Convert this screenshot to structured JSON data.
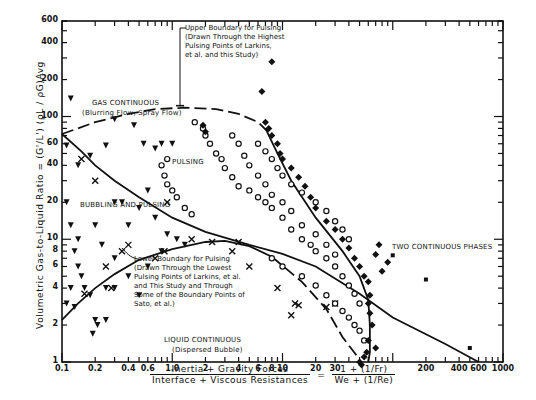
{
  "chart_data": {
    "type": "scatter",
    "title": "",
    "xlabel": "Inertia + Gravity Forces / Interface + Viscous Resistances = (1 + (1/Fr)) / (We + (1/Re))",
    "xlabel_numerator": "Inertia + Gravity Forces",
    "xlabel_denominator": "Interface + Viscous Resistances",
    "xlabel_formula_numerator": "1 + (1/Fr)",
    "xlabel_formula_denominator": "We + (1/Re)",
    "xlabel_equals": "=",
    "ylabel": "Volumetric Gas-to-Liquid Ratio = (G'/L') (ρL / ρG)Avg",
    "xscale": "log",
    "yscale": "log",
    "xlim": [
      0.1,
      1000
    ],
    "ylim": [
      1,
      600
    ],
    "grid": false,
    "x_ticks": [
      {
        "value": 0.1,
        "label": "0.1"
      },
      {
        "value": 0.2,
        "label": "0.2"
      },
      {
        "value": 0.4,
        "label": "0.4"
      },
      {
        "value": 0.6,
        "label": "0.6"
      },
      {
        "value": 1.0,
        "label": "1.0"
      },
      {
        "value": 2,
        "label": "2"
      },
      {
        "value": 4,
        "label": "4"
      },
      {
        "value": 6,
        "label": "6"
      },
      {
        "value": 8,
        "label": "8"
      },
      {
        "value": 10,
        "label": "10"
      },
      {
        "value": 20,
        "label": "20"
      },
      {
        "value": 30,
        "label": "30"
      },
      {
        "value": 200,
        "label": "200"
      },
      {
        "value": 400,
        "label": "400"
      },
      {
        "value": 600,
        "label": "600"
      },
      {
        "value": 1000,
        "label": "1000"
      }
    ],
    "y_ticks": [
      {
        "value": 1,
        "label": "1"
      },
      {
        "value": 2,
        "label": "2"
      },
      {
        "value": 4,
        "label": "4"
      },
      {
        "value": 6,
        "label": "6"
      },
      {
        "value": 8,
        "label": "8"
      },
      {
        "value": 10,
        "label": "10"
      },
      {
        "value": 20,
        "label": "20"
      },
      {
        "value": 40,
        "label": "40"
      },
      {
        "value": 60,
        "label": "60"
      },
      {
        "value": 100,
        "label": "100"
      },
      {
        "value": 200,
        "label": "200"
      },
      {
        "value": 400,
        "label": "400"
      },
      {
        "value": 600,
        "label": "600"
      }
    ],
    "regions": [
      {
        "name": "GAS CONTINUOUS",
        "subtitle": "(Blurring Flow, Spray Flow)",
        "x": 0.55,
        "y": 190
      },
      {
        "name": "PULSING",
        "x": 1.9,
        "y": 32
      },
      {
        "name": "BUBBLING AND PULSING",
        "x": 0.3,
        "y": 13
      },
      {
        "name": "LIQUID CONTINUOUS",
        "subtitle": "(Dispersed Bubble)",
        "x": 4.0,
        "y": 1.35
      },
      {
        "name": "TWO CONTINUOUS PHASES",
        "x": 350,
        "y": 5.3
      }
    ],
    "annotations": [
      {
        "text": "Upper Boundary for Pulsing (Drawn Through the Highest Pulsing Points of Larkins, et al. and this Study)",
        "points_to": {
          "x": 1.3,
          "y": 118
        }
      },
      {
        "text": "Lower Boundary for Pulsing (Drawn Through the Lowest Pulsing Points of Larkins, et al. and This Study and Through Some of the Boundary Points of Sato, et al.)",
        "points_to": {
          "x": 0.62,
          "y": 5.0
        }
      }
    ],
    "boundary_lines": [
      {
        "name": "Upper Boundary for Pulsing",
        "style": "dashed",
        "points": [
          [
            0.1,
            72
          ],
          [
            0.2,
            90
          ],
          [
            0.4,
            105
          ],
          [
            0.7,
            115
          ],
          [
            1.3,
            118
          ],
          [
            2.5,
            115
          ],
          [
            4,
            105
          ],
          [
            6,
            90
          ],
          [
            8,
            70
          ]
        ]
      },
      {
        "name": "Pulsing / Bubbling boundary",
        "style": "solid",
        "points": [
          [
            0.1,
            72
          ],
          [
            0.15,
            52
          ],
          [
            0.2,
            40
          ],
          [
            0.3,
            30
          ],
          [
            0.5,
            22
          ],
          [
            1.0,
            15
          ],
          [
            2.0,
            11.5
          ],
          [
            5,
            9
          ],
          [
            10,
            7.6
          ],
          [
            20,
            6.0
          ],
          [
            50,
            3.6
          ],
          [
            100,
            2.3
          ],
          [
            300,
            1.4
          ],
          [
            600,
            1.0
          ]
        ]
      },
      {
        "name": "Lower Boundary for Pulsing",
        "style": "solid-then-dashed",
        "points": [
          [
            0.1,
            2.2
          ],
          [
            0.14,
            3.0
          ],
          [
            0.2,
            4.0
          ],
          [
            0.3,
            5.2
          ],
          [
            0.5,
            6.8
          ],
          [
            1.0,
            8.3
          ],
          [
            2.0,
            9.5
          ],
          [
            3.0,
            9.7
          ],
          [
            5,
            8.8
          ],
          [
            8,
            7.2
          ],
          [
            15,
            4.5
          ],
          [
            25,
            2.7
          ],
          [
            35,
            1.6
          ],
          [
            50,
            1.05
          ]
        ]
      },
      {
        "name": "Pulsing / Two continuous phases boundary",
        "style": "solid",
        "points": [
          [
            7,
            80
          ],
          [
            9,
            50
          ],
          [
            12,
            30
          ],
          [
            20,
            15
          ],
          [
            35,
            8
          ],
          [
            50,
            5
          ],
          [
            60,
            3.2
          ],
          [
            62,
            2.0
          ],
          [
            62,
            1.2
          ],
          [
            60,
            1.0
          ]
        ]
      }
    ],
    "series": [
      {
        "name": "Gas continuous / bubbling (inverted triangles)",
        "marker": "triangle-down",
        "points": [
          [
            0.12,
            140
          ],
          [
            0.11,
            58
          ],
          [
            0.14,
            40
          ],
          [
            0.18,
            48
          ],
          [
            0.25,
            58
          ],
          [
            0.3,
            95
          ],
          [
            0.45,
            85
          ],
          [
            0.7,
            55
          ],
          [
            0.55,
            60
          ],
          [
            0.8,
            60
          ],
          [
            1.0,
            60
          ],
          [
            0.11,
            20
          ],
          [
            0.12,
            13
          ],
          [
            0.14,
            10
          ],
          [
            0.13,
            8
          ],
          [
            0.14,
            6
          ],
          [
            0.15,
            5
          ],
          [
            0.12,
            4
          ],
          [
            0.11,
            3
          ],
          [
            0.13,
            2.8
          ],
          [
            0.16,
            4.0
          ],
          [
            0.18,
            3.5
          ],
          [
            0.2,
            2.2
          ],
          [
            0.21,
            2.0
          ],
          [
            0.19,
            1.7
          ],
          [
            0.25,
            2.2
          ],
          [
            0.3,
            20
          ],
          [
            0.35,
            20
          ],
          [
            0.2,
            13
          ],
          [
            0.23,
            9
          ],
          [
            0.3,
            7
          ],
          [
            0.4,
            13
          ],
          [
            0.5,
            18
          ],
          [
            0.6,
            25
          ],
          [
            0.7,
            15
          ],
          [
            0.9,
            11
          ],
          [
            1.1,
            10
          ],
          [
            1.3,
            9
          ],
          [
            0.8,
            8
          ],
          [
            0.6,
            6
          ],
          [
            0.4,
            5
          ],
          [
            0.3,
            4
          ],
          [
            0.25,
            4.0
          ],
          [
            0.5,
            3.5
          ]
        ]
      },
      {
        "name": "Bubbling x-marks",
        "marker": "x",
        "points": [
          [
            0.2,
            30
          ],
          [
            0.15,
            45
          ],
          [
            0.9,
            20
          ],
          [
            0.85,
            8
          ],
          [
            0.7,
            7
          ],
          [
            0.4,
            9
          ],
          [
            0.35,
            8
          ],
          [
            0.25,
            6
          ],
          [
            0.28,
            4
          ],
          [
            0.16,
            3.6
          ],
          [
            2.3,
            9.5
          ],
          [
            3.5,
            8
          ],
          [
            4.0,
            9.5
          ],
          [
            1.5,
            10
          ],
          [
            5,
            6
          ],
          [
            9,
            4.0
          ],
          [
            13,
            3.0
          ],
          [
            14,
            2.9
          ],
          [
            12,
            2.4
          ],
          [
            25,
            2.8
          ],
          [
            30,
            3.0
          ]
        ]
      },
      {
        "name": "Pulsing (open circles)",
        "marker": "circle-open",
        "points": [
          [
            1.6,
            90
          ],
          [
            1.9,
            80
          ],
          [
            2.0,
            70
          ],
          [
            2.2,
            60
          ],
          [
            2.5,
            50
          ],
          [
            2.8,
            45
          ],
          [
            3.0,
            38
          ],
          [
            3.5,
            32
          ],
          [
            4.0,
            27
          ],
          [
            5,
            25
          ],
          [
            6,
            22
          ],
          [
            7,
            20
          ],
          [
            8,
            18
          ],
          [
            10,
            15
          ],
          [
            12,
            12
          ],
          [
            15,
            10
          ],
          [
            18,
            9
          ],
          [
            20,
            8
          ],
          [
            25,
            7
          ],
          [
            30,
            6
          ],
          [
            35,
            5
          ],
          [
            40,
            4.2
          ],
          [
            45,
            3.6
          ],
          [
            50,
            3.0
          ],
          [
            3.5,
            70
          ],
          [
            4,
            60
          ],
          [
            4.5,
            48
          ],
          [
            5,
            40
          ],
          [
            6,
            33
          ],
          [
            7,
            28
          ],
          [
            8,
            23
          ],
          [
            10,
            20
          ],
          [
            12,
            17
          ],
          [
            15,
            13
          ],
          [
            20,
            11
          ],
          [
            25,
            9
          ],
          [
            30,
            7.5
          ],
          [
            6,
            60
          ],
          [
            7,
            52
          ],
          [
            8,
            45
          ],
          [
            9,
            38
          ],
          [
            10,
            33
          ],
          [
            12,
            28
          ],
          [
            15,
            24
          ],
          [
            20,
            20
          ],
          [
            25,
            17
          ],
          [
            30,
            14
          ],
          [
            35,
            12
          ],
          [
            40,
            10
          ],
          [
            8,
            7
          ],
          [
            10,
            6
          ],
          [
            15,
            5
          ],
          [
            20,
            4.2
          ],
          [
            25,
            3.5
          ],
          [
            30,
            3.0
          ],
          [
            35,
            2.6
          ],
          [
            40,
            2.3
          ],
          [
            45,
            2.0
          ],
          [
            50,
            1.8
          ],
          [
            55,
            1.5
          ],
          [
            0.9,
            28
          ],
          [
            0.85,
            33
          ],
          [
            0.8,
            40
          ],
          [
            0.9,
            45
          ],
          [
            1.0,
            25
          ],
          [
            1.1,
            22
          ],
          [
            1.3,
            18
          ],
          [
            1.5,
            16
          ]
        ]
      },
      {
        "name": "Two continuous phases (filled diamonds)",
        "marker": "diamond-filled",
        "points": [
          [
            6.5,
            160
          ],
          [
            7,
            90
          ],
          [
            7.5,
            80
          ],
          [
            8,
            70
          ],
          [
            9,
            60
          ],
          [
            9.5,
            50
          ],
          [
            10,
            45
          ],
          [
            12,
            38
          ],
          [
            14,
            32
          ],
          [
            16,
            27
          ],
          [
            18,
            22
          ],
          [
            20,
            18
          ],
          [
            25,
            14
          ],
          [
            30,
            12
          ],
          [
            35,
            10
          ],
          [
            40,
            8.5
          ],
          [
            45,
            7
          ],
          [
            50,
            6
          ],
          [
            55,
            5
          ],
          [
            60,
            4.5
          ],
          [
            62,
            3.5
          ],
          [
            60,
            3.0
          ],
          [
            62,
            2.5
          ],
          [
            65,
            2.0
          ],
          [
            60,
            1.5
          ],
          [
            58,
            1.2
          ],
          [
            55,
            1.1
          ],
          [
            50,
            1.0
          ],
          [
            52,
            0.95
          ],
          [
            70,
            1.3
          ],
          [
            80,
            5.5
          ],
          [
            90,
            6.5
          ],
          [
            70,
            7.5
          ],
          [
            75,
            9.0
          ],
          [
            8,
            280
          ],
          [
            1.9,
            85
          ],
          [
            2.0,
            75
          ]
        ]
      },
      {
        "name": "Two continuous phases line markers",
        "marker": "square-filled",
        "points": [
          [
            100,
            7.4
          ],
          [
            200,
            4.7
          ],
          [
            500,
            1.3
          ]
        ]
      }
    ]
  },
  "labels": {
    "y_axis_title": "Volumetric Gas-to-Liquid Ratio = (G'/L') (ρL / ρG)Avg",
    "x_num": "Inertia + Gravity Forces",
    "x_den": "Interface + Viscous Resistances",
    "equals": "=",
    "f_num": "1 + (1/Fr)",
    "f_den": "We + (1/Re)",
    "gas_continuous": "GAS CONTINUOUS",
    "gas_continuous_sub": "(Blurring Flow, Spray Flow)",
    "pulsing": "PULSING",
    "bubbling": "BUBBLING AND PULSING",
    "liquid_continuous": "LIQUID CONTINUOUS",
    "liquid_continuous_sub": "(Dispersed Bubble)",
    "two_phases": "TWO CONTINUOUS PHASES",
    "upper_note_1": "Upper Boundary for Pulsing",
    "upper_note_2": "(Drawn Through the Highest",
    "upper_note_3": "Pulsing Points of Larkins,",
    "upper_note_4": "et al. and this Study)",
    "lower_note_1": "Lower Boundary for Pulsing",
    "lower_note_2": "(Drawn Through the Lowest",
    "lower_note_3": "Pulsing Points of Larkins, et al.",
    "lower_note_4": "and This Study and Through",
    "lower_note_5": "Some of the Boundary Points of",
    "lower_note_6": "Sato, et al.)"
  }
}
